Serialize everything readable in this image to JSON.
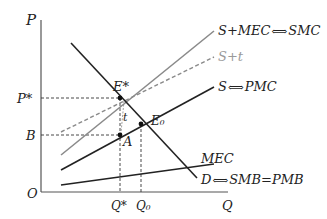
{
  "diagram": {
    "type": "economics-externality-graph",
    "axes": {
      "y_label": "P",
      "x_label": "Q",
      "origin_label": "O"
    },
    "curves": [
      {
        "id": "smc",
        "label": "S+MEC",
        "arrow": "⟺",
        "label2": "SMC",
        "style": "solid",
        "color": "#8a8a8a"
      },
      {
        "id": "s_plus_t",
        "label": "S+t",
        "style": "dashed",
        "color": "#a0a0a0"
      },
      {
        "id": "pmc",
        "label": "S",
        "arrow": "⟺",
        "label2": "PMC",
        "style": "solid",
        "color": "#222222"
      },
      {
        "id": "mec",
        "label": "MEC",
        "style": "solid",
        "color": "#222222"
      },
      {
        "id": "demand",
        "label": "D",
        "arrow": "⟺",
        "label2": "SMB=PMB",
        "style": "solid",
        "color": "#222222"
      }
    ],
    "points": {
      "e_star": "E*",
      "e_zero": "E₀",
      "a": "A",
      "t": "t"
    },
    "y_ticks": {
      "p_star": "P*",
      "b": "B"
    },
    "x_ticks": {
      "q_star": "Q*",
      "q_zero": "Q₀"
    }
  }
}
